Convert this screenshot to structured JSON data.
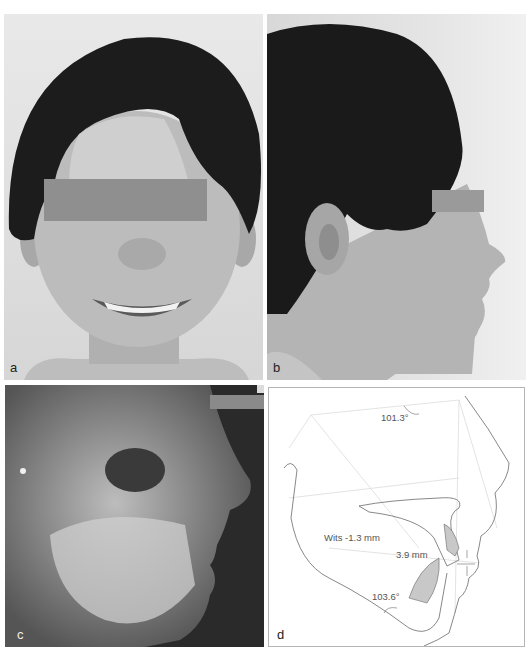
{
  "figure": {
    "panels": [
      {
        "id": "a",
        "label": "a",
        "content": "frontal smiling facial photograph, eyes masked with gray bar"
      },
      {
        "id": "b",
        "label": "b",
        "content": "right profile facial photograph, eyes masked with gray bar"
      },
      {
        "id": "c",
        "label": "c",
        "content": "lateral cephalometric radiograph"
      },
      {
        "id": "d",
        "label": "d",
        "content": "cephalometric tracing"
      }
    ],
    "tracing_annotations": {
      "angle_top": "101.3°",
      "wits": "Wits -1.3 mm",
      "overjet": "3.9 mm",
      "angle_bottom": "103.6°"
    },
    "colors": {
      "mask_bar": "#8f8f8f",
      "tracing_line": "#6a6a6a",
      "tooth_fill": "#c8c8c8",
      "reference_lines": "#dcdcdc"
    }
  }
}
